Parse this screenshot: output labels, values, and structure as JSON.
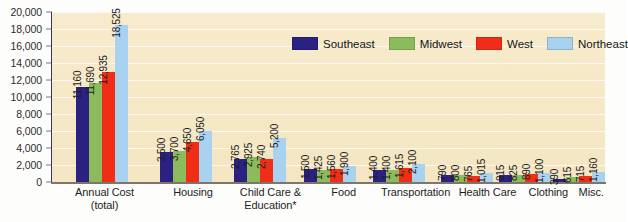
{
  "chart_data": {
    "type": "bar",
    "title": "",
    "xlabel": "",
    "ylabel": "",
    "ylim": [
      0,
      20000
    ],
    "grid": true,
    "legend_position": "top-right-inside",
    "categories": [
      "Annual Cost\n(total)",
      "Housing",
      "Child Care &\nEducation*",
      "Food",
      "Transportation",
      "Health Care",
      "Clothing",
      "Misc."
    ],
    "category_lines": [
      [
        "Annual Cost",
        "(total)"
      ],
      [
        "Housing",
        ""
      ],
      [
        "Child Care &",
        "Education*"
      ],
      [
        "Food",
        ""
      ],
      [
        "Transportation",
        ""
      ],
      [
        "Health Care",
        ""
      ],
      [
        "Clothing",
        ""
      ],
      [
        "Misc.",
        ""
      ]
    ],
    "series": [
      {
        "name": "Southeast",
        "color": "#2b2180",
        "values": [
          11160,
          3500,
          2765,
          1500,
          1400,
          790,
          815,
          390
        ],
        "labels": [
          "11,160",
          "3,500",
          "2,765",
          "1,500",
          "1,400",
          "790",
          "815",
          "390"
        ]
      },
      {
        "name": "Midwest",
        "color": "#8cbb5e",
        "values": [
          11690,
          3700,
          2925,
          1425,
          1400,
          800,
          825,
          615
        ],
        "labels": [
          "11,690",
          "3,700",
          "2,925",
          "1,425",
          "1,400",
          "800",
          "825",
          "615"
        ]
      },
      {
        "name": "West",
        "color": "#f02d16",
        "values": [
          12935,
          4650,
          2740,
          1560,
          1615,
          765,
          890,
          715
        ],
        "labels": [
          "12,935",
          "4,650",
          "2,740",
          "1,560",
          "1,615",
          "765",
          "890",
          "715"
        ]
      },
      {
        "name": "Northeast",
        "color": "#a8d2f0",
        "values": [
          18525,
          6050,
          5200,
          1900,
          2100,
          1015,
          1100,
          1160
        ],
        "labels": [
          "18,525",
          "6,050",
          "5,200",
          "1,900",
          "2,100",
          "1,015",
          "1,100",
          "1,160"
        ]
      }
    ],
    "y_ticks": [
      {
        "value": 20000,
        "label": "20,000"
      },
      {
        "value": 18000,
        "label": "18,000"
      },
      {
        "value": 16000,
        "label": "16,000"
      },
      {
        "value": 14000,
        "label": "14,000"
      },
      {
        "value": 12000,
        "label": "12,000"
      },
      {
        "value": 10000,
        "label": "10,000"
      },
      {
        "value": 8000,
        "label": "8,000"
      },
      {
        "value": 6000,
        "label": "6,000"
      },
      {
        "value": 4000,
        "label": "4,000"
      },
      {
        "value": 2000,
        "label": "2,000"
      },
      {
        "value": 0,
        "label": "0"
      }
    ]
  },
  "colors": {
    "plot_background": "#f6e9c8",
    "gridline": "#ffffff",
    "axis": "#3b3566",
    "text": "#1d1d1d",
    "page_background": "#fdfdfb"
  }
}
